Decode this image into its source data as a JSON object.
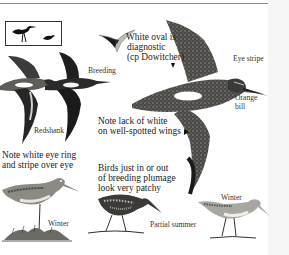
{
  "page": {
    "type": "field-guide-plate"
  },
  "labels": {
    "white_oval_line1": "White oval is",
    "white_oval_line2": "diagnostic",
    "white_oval_line3": "(cp Dowitcher)",
    "breeding": "Breeding",
    "eye_stripe": "Eye stripe",
    "orange_bill_line1": "Orange",
    "orange_bill_line2": "bill",
    "redshank": "Redshank",
    "note_lack_line1": "Note lack of white",
    "note_lack_line2": "on well-spotted wings",
    "note_eye_ring_line1": "Note white eye ring",
    "note_eye_ring_line2": "and stripe over eye",
    "birds_just_line1": "Birds just in or out",
    "birds_just_line2": "of breeding plumage",
    "birds_just_line3": "look very patchy",
    "winter_left": "Winter",
    "partial_summer": "Partial summer",
    "winter_right": "Winter"
  },
  "colors": {
    "ink": "#1a1a1a",
    "bird_dark": "#2a2a2a",
    "bird_mid": "#6b6a66",
    "bird_light": "#c9c7c2",
    "rule": "#8a8a8a"
  },
  "illustrations": [
    {
      "name": "size-silhouettes",
      "description": "Standing shorebird silhouette and small bird silhouette in box"
    },
    {
      "name": "small-flying-bird",
      "description": "Small flying bird top-down"
    },
    {
      "name": "redshank-flying",
      "description": "Redshank in flight"
    },
    {
      "name": "breeding-flying",
      "description": "Breeding plumage bird in flight"
    },
    {
      "name": "large-flying-bird",
      "description": "Large flying bird with white wing oval"
    },
    {
      "name": "winter-standing-left",
      "description": "Winter plumage bird on grassy ground"
    },
    {
      "name": "partial-summer-bird",
      "description": "Partial summer plumage bird feeding"
    },
    {
      "name": "winter-standing-right",
      "description": "Winter plumage bird standing"
    }
  ]
}
